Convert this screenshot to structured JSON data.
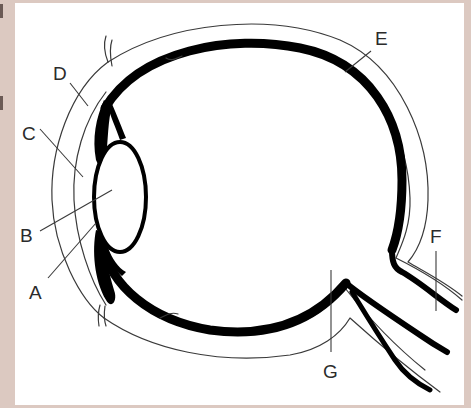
{
  "diagram": {
    "colors": {
      "background": "#dcc9c1",
      "panel": "#ffffff",
      "ink": "#000000",
      "line": "#3a3a3a"
    },
    "labels": [
      {
        "id": "A",
        "text": "A"
      },
      {
        "id": "B",
        "text": "B"
      },
      {
        "id": "C",
        "text": "C"
      },
      {
        "id": "D",
        "text": "D"
      },
      {
        "id": "E",
        "text": "E"
      },
      {
        "id": "F",
        "text": "F"
      },
      {
        "id": "G",
        "text": "G"
      }
    ]
  }
}
